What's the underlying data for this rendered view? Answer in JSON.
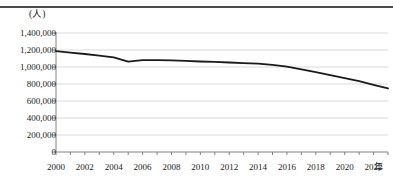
{
  "figure": {
    "unit_label": "(人)",
    "xaxis_unit": "年"
  },
  "chart_data": {
    "type": "line",
    "title": "",
    "subtitle": "",
    "xlabel": "年",
    "ylabel": "(人)",
    "grid": true,
    "legend": false,
    "xlim": [
      2000,
      2023
    ],
    "ylim": [
      0,
      1400000
    ],
    "ytick_labels": [
      "1,400,000",
      "1,200,000",
      "1,000,000",
      "800,000",
      "600,000",
      "400,000",
      "200,000",
      "0"
    ],
    "ytick_values": [
      1400000,
      1200000,
      1000000,
      800000,
      600000,
      400000,
      200000,
      0
    ],
    "xtick_labels": [
      "2000",
      "2002",
      "2004",
      "2006",
      "2008",
      "2010",
      "2012",
      "2014",
      "2016",
      "2018",
      "2020",
      "2022"
    ],
    "xtick_values": [
      2000,
      2002,
      2004,
      2006,
      2008,
      2010,
      2012,
      2014,
      2016,
      2018,
      2020,
      2022
    ],
    "minor_tick_interval": 1,
    "line_color": "#1a1a1a",
    "grid_color": "#d9d9d9",
    "axis_color": "#808080",
    "series": [
      {
        "name": "人数",
        "x": [
          2000,
          2001,
          2002,
          2003,
          2004,
          2005,
          2006,
          2007,
          2008,
          2009,
          2010,
          2011,
          2012,
          2013,
          2014,
          2015,
          2016,
          2017,
          2018,
          2019,
          2020,
          2021,
          2022,
          2023
        ],
        "values": [
          1188000,
          1170000,
          1153000,
          1135000,
          1113000,
          1063000,
          1080000,
          1081000,
          1078000,
          1072000,
          1065000,
          1060000,
          1053000,
          1045000,
          1040000,
          1025000,
          1005000,
          972000,
          940000,
          905000,
          870000,
          835000,
          790000,
          748000
        ]
      }
    ]
  }
}
